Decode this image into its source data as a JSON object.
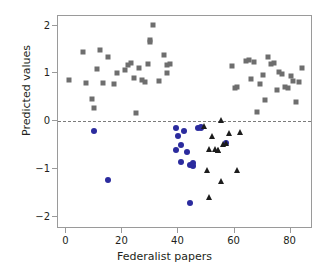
{
  "chart_data": {
    "type": "scatter",
    "title": "",
    "xlabel": "Federalist papers",
    "ylabel": "Predicted values",
    "xlim": [
      -3,
      88
    ],
    "ylim": [
      -2.25,
      2.2
    ],
    "xticks": [
      0,
      20,
      40,
      60,
      80
    ],
    "yticks": [
      2,
      1,
      0,
      -1,
      -2
    ],
    "xticklabels": [
      "0",
      "20",
      "40",
      "60",
      "80"
    ],
    "yticklabels": [
      "2",
      "1",
      "0",
      "−1",
      "−2"
    ],
    "grid": false,
    "legend": "none",
    "annotations": [
      {
        "type": "hline",
        "y": 0,
        "style": "dashed",
        "color": "#7b7b7b"
      }
    ],
    "colors": {
      "hamilton_squares": "#6e6e6e",
      "madison_circles": "#2b2b9e",
      "disputed_triangles": "#1c1c1c",
      "axis": "#9a9a9a",
      "text": "#231f20",
      "background": "#ffffff"
    },
    "series": [
      {
        "name": "Hamilton papers",
        "marker": "square",
        "color": "#6e6e6e",
        "points": [
          [
            1,
            0.87
          ],
          [
            6,
            1.44
          ],
          [
            7,
            0.8
          ],
          [
            9,
            0.47
          ],
          [
            10,
            0.28
          ],
          [
            11,
            1.09
          ],
          [
            12,
            1.5
          ],
          [
            13,
            0.79
          ],
          [
            15,
            1.34
          ],
          [
            17,
            0.77
          ],
          [
            18,
            1.01
          ],
          [
            21,
            1.07
          ],
          [
            22,
            1.18
          ],
          [
            23,
            1.21
          ],
          [
            24,
            0.9
          ],
          [
            25,
            0.17
          ],
          [
            26,
            1.12
          ],
          [
            27,
            0.86
          ],
          [
            28,
            0.83
          ],
          [
            29,
            1.2
          ],
          [
            30,
            1.65
          ],
          [
            30,
            1.7
          ],
          [
            31,
            2.01
          ],
          [
            33,
            0.84
          ],
          [
            35,
            1.39
          ],
          [
            36,
            1.17
          ],
          [
            36,
            1.0
          ],
          [
            37,
            1.2
          ],
          [
            59,
            1.15
          ],
          [
            60,
            0.7
          ],
          [
            61,
            0.72
          ],
          [
            64,
            1.27
          ],
          [
            65,
            1.29
          ],
          [
            66,
            0.89
          ],
          [
            67,
            1.23
          ],
          [
            68,
            0.19
          ],
          [
            69,
            0.78
          ],
          [
            70,
            0.96
          ],
          [
            71,
            0.45
          ],
          [
            72,
            1.34
          ],
          [
            73,
            1.19
          ],
          [
            74,
            1.21
          ],
          [
            75,
            0.65
          ],
          [
            76,
            1.03
          ],
          [
            77,
            0.99
          ],
          [
            78,
            0.72
          ],
          [
            79,
            0.69
          ],
          [
            80,
            0.94
          ],
          [
            81,
            0.85
          ],
          [
            82,
            0.4
          ],
          [
            83,
            0.83
          ],
          [
            84,
            1.11
          ]
        ]
      },
      {
        "name": "Madison papers",
        "marker": "circle",
        "color": "#2b2b9e",
        "points": [
          [
            10,
            -0.21
          ],
          [
            15,
            -1.22
          ],
          [
            39,
            -0.13
          ],
          [
            39,
            -0.6
          ],
          [
            40,
            -0.31
          ],
          [
            41,
            -0.5
          ],
          [
            41,
            -0.86
          ],
          [
            42,
            -0.2
          ],
          [
            43,
            -0.64
          ],
          [
            44,
            -0.91
          ],
          [
            44,
            -1.71
          ],
          [
            45,
            -0.88
          ],
          [
            45,
            -0.94
          ],
          [
            47,
            -0.13
          ],
          [
            48,
            -0.13
          ],
          [
            48,
            -0.12
          ],
          [
            57,
            -0.45
          ]
        ]
      },
      {
        "name": "Disputed papers",
        "marker": "triangle",
        "color": "#1c1c1c",
        "points": [
          [
            49,
            -0.1
          ],
          [
            50,
            -1.02
          ],
          [
            51,
            -0.57
          ],
          [
            51,
            -1.58
          ],
          [
            52,
            -0.3
          ],
          [
            53,
            -0.58
          ],
          [
            54,
            -0.59
          ],
          [
            54,
            -0.6
          ],
          [
            55,
            0.03
          ],
          [
            55,
            -1.24
          ],
          [
            56,
            -0.47
          ],
          [
            57,
            -0.45
          ],
          [
            58,
            -0.25
          ],
          [
            61,
            -1.02
          ],
          [
            62,
            -0.23
          ]
        ]
      }
    ]
  }
}
